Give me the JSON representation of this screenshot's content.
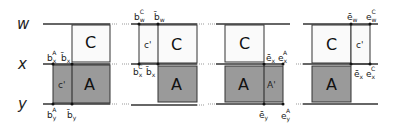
{
  "rows": {
    "w": "w",
    "x": "x",
    "y": "y"
  },
  "colors": {
    "grey_fill": "#9a9a9a",
    "light_fill": "#fafafa",
    "line": "#333333"
  },
  "panels": [
    {
      "id": 1,
      "boxes": {
        "C": "C",
        "A": "A",
        "cprime": "c'"
      },
      "labels": {
        "top_left": {
          "base": "b",
          "sup": "A",
          "sub": "x"
        },
        "top_right": {
          "base": "b̄",
          "sub": "x"
        },
        "bot_left": {
          "base": "b",
          "sup": "A",
          "sub": "y"
        },
        "bot_right": {
          "base": "b̄",
          "sub": "y"
        }
      }
    },
    {
      "id": 2,
      "boxes": {
        "C": "C",
        "A": "A",
        "cprime": "c'"
      },
      "labels": {
        "top_left": {
          "base": "b",
          "sup": "C",
          "sub": "w"
        },
        "top_right": {
          "base": "b̄",
          "sub": "w"
        },
        "mid_left": {
          "base": "b",
          "sup": "C",
          "sub": "x"
        },
        "mid_right": {
          "base": "b̄",
          "sub": "x"
        }
      }
    },
    {
      "id": 3,
      "boxes": {
        "C": "C",
        "A": "A",
        "aprime": "A'"
      },
      "labels": {
        "mid_left": {
          "base": "ē",
          "sub": "x"
        },
        "mid_right": {
          "base": "e",
          "sup": "A",
          "sub": "x"
        },
        "bot_left": {
          "base": "ē",
          "sub": "y"
        },
        "bot_right": {
          "base": "e",
          "sup": "A",
          "sub": "y"
        }
      }
    },
    {
      "id": 4,
      "boxes": {
        "C": "C",
        "A": "A",
        "cprime": "c'"
      },
      "labels": {
        "top_left": {
          "base": "ē",
          "sub": "w"
        },
        "top_right": {
          "base": "e",
          "sup": "C",
          "sub": "w"
        },
        "mid_left": {
          "base": "ē",
          "sub": "x"
        },
        "mid_right": {
          "base": "e",
          "sup": "C",
          "sub": "x"
        }
      }
    }
  ]
}
